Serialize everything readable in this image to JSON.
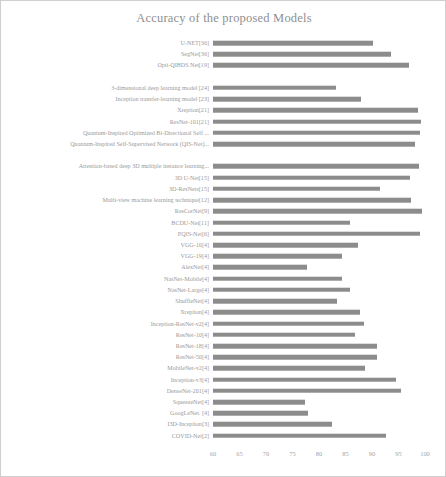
{
  "chart": {
    "title": "Accuracy of the proposed Models",
    "bar_color": "#8c8c8c",
    "text_color": "#9a9a9a"
  },
  "chart_data": {
    "type": "bar",
    "orientation": "horizontal",
    "title": "Accuracy of the proposed Models",
    "xlabel": "",
    "ylabel": "",
    "xlim": [
      60,
      100
    ],
    "grid": false,
    "legend": "none",
    "xticks": [
      60,
      65,
      70,
      75,
      80,
      85,
      90,
      95,
      100
    ],
    "categories": [
      "U-NET[36]",
      "SegNet[36]",
      "Opti-QIBDS Net[19]",
      "",
      "3-dimensional deep learning model [24]",
      "Inception transfer-learning model [23]",
      "Xreption[21]",
      "ResNet-101[21]",
      "Quantum-Inspired Optimized Bi-Directional Self ...",
      "Quantum-Inspired Self-Supervised Network (QIS-Net)...",
      "",
      "Attention-based deep 3D multiple instance learning...",
      "3D U-Net[15]",
      "3D-ResNets[15]",
      "Multi-view machine learning technique[12]",
      "ResCorNet[9]",
      "BCDU-Net[11]",
      "PQIS-Net[6]",
      "VGG-16[4]",
      "VGG-19[4]",
      "AlexNet[4]",
      "NasNet-Mobile[4]",
      "NasNet-Large[4]",
      "ShuffleNet[4]",
      "Xreption[4]",
      "Inception-ResNet-v2[4]",
      "ResNet-10[4]",
      "ResNet-18[4]",
      "ResNet-50[4]",
      "MobileNet-v2[4]",
      "Inception-v3[4]",
      "DenseNet-201[4]",
      "SqueezeNet[4]",
      "GoogLeNet. [4]",
      "I3D-Inception[3]",
      "COVID-Net[2]"
    ],
    "values": [
      90.2,
      93.6,
      97.0,
      null,
      83.2,
      88.0,
      98.6,
      99.3,
      99.0,
      98.1,
      null,
      98.8,
      97.1,
      91.6,
      97.3,
      99.5,
      85.8,
      99.1,
      87.3,
      84.4,
      77.7,
      84.4,
      85.8,
      83.4,
      87.8,
      88.5,
      86.7,
      90.9,
      91.0,
      88.7,
      94.6,
      95.5,
      77.4,
      78.0,
      82.5,
      92.6
    ]
  }
}
